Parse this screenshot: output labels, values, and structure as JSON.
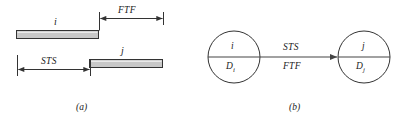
{
  "figure": {
    "caption_a": "(a)",
    "caption_b": "(b)",
    "panel_a": {
      "bar_i_label": "i",
      "bar_j_label": "j",
      "dimension_ftf": "FTF",
      "dimension_sts": "STS",
      "bar_fill": "#c8c8c8",
      "bar_stroke": "#333333",
      "line_color": "#333333"
    },
    "panel_b": {
      "node_left_top": "i",
      "node_left_bottom_base": "D",
      "node_left_bottom_sub": "i",
      "node_right_top": "j",
      "node_right_bottom_base": "D",
      "node_right_bottom_sub": "j",
      "arrow_label_top": "STS",
      "arrow_label_bottom": "FTF",
      "node_stroke": "#333333",
      "arrow_color": "#444444"
    }
  }
}
